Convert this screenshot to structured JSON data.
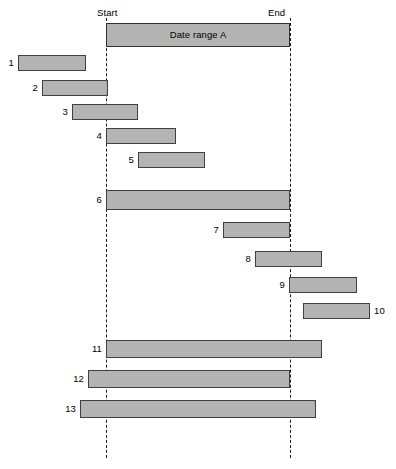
{
  "figure": {
    "type": "gantt-range-comparison",
    "width": 396,
    "height": 469,
    "background": "#ffffff",
    "bar_fill": "#b3b3b3",
    "bar_stroke": "#404040",
    "guide_stroke": "#1a1a1a"
  },
  "axis": {
    "start_label": "Start",
    "end_label": "End",
    "start_x": 106,
    "end_x": 290,
    "guide_top": 18,
    "guide_bottom": 458
  },
  "header_bar": {
    "label": "Date range A",
    "x1": 106,
    "x2": 290,
    "y": 23,
    "height": 24
  },
  "chart_data": {
    "type": "bar",
    "orientation": "horizontal",
    "title": "Date range A",
    "xlabel": "",
    "ylabel": "",
    "grid": false,
    "legend": "none",
    "reference_lines": [
      {
        "name": "Start",
        "x": 106
      },
      {
        "name": "End",
        "x": 290
      }
    ],
    "categories": [
      "1",
      "2",
      "3",
      "4",
      "5",
      "6",
      "7",
      "8",
      "9",
      "10",
      "11",
      "12",
      "13"
    ],
    "bars": [
      {
        "label": "1",
        "x1": 18,
        "x2": 86,
        "y": 55,
        "height": 16,
        "label_side": "left",
        "relation": "before-start"
      },
      {
        "label": "2",
        "x1": 42,
        "x2": 108,
        "y": 80,
        "height": 16,
        "label_side": "left",
        "relation": "meets-start"
      },
      {
        "label": "3",
        "x1": 72,
        "x2": 138,
        "y": 104,
        "height": 16,
        "label_side": "left",
        "relation": "overlaps-start"
      },
      {
        "label": "4",
        "x1": 106,
        "x2": 176,
        "y": 128,
        "height": 16,
        "label_side": "left",
        "relation": "starts-at-start"
      },
      {
        "label": "5",
        "x1": 138,
        "x2": 205,
        "y": 152,
        "height": 16,
        "label_side": "left",
        "relation": "during"
      },
      {
        "label": "6",
        "x1": 106,
        "x2": 290,
        "y": 190,
        "height": 20,
        "label_side": "left",
        "relation": "equals-range"
      },
      {
        "label": "7",
        "x1": 223,
        "x2": 290,
        "y": 222,
        "height": 16,
        "label_side": "left",
        "relation": "finishes-at-end"
      },
      {
        "label": "8",
        "x1": 255,
        "x2": 322,
        "y": 251,
        "height": 16,
        "label_side": "left",
        "relation": "overlaps-end"
      },
      {
        "label": "9",
        "x1": 289,
        "x2": 357,
        "y": 277,
        "height": 16,
        "label_side": "left",
        "relation": "meets-end"
      },
      {
        "label": "10",
        "x1": 303,
        "x2": 370,
        "y": 303,
        "height": 16,
        "label_side": "right",
        "relation": "after-end"
      },
      {
        "label": "11",
        "x1": 106,
        "x2": 322,
        "y": 340,
        "height": 18,
        "label_side": "left",
        "relation": "starts-at-start-extends"
      },
      {
        "label": "12",
        "x1": 88,
        "x2": 290,
        "y": 370,
        "height": 18,
        "label_side": "left",
        "relation": "precedes-ends-at-end"
      },
      {
        "label": "13",
        "x1": 80,
        "x2": 316,
        "y": 400,
        "height": 18,
        "label_side": "left",
        "relation": "contains-range"
      }
    ]
  }
}
